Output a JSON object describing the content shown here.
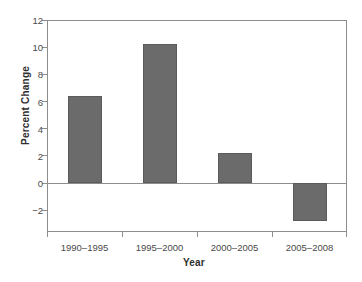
{
  "chart_data": {
    "type": "bar",
    "title": "",
    "xlabel": "Year",
    "ylabel": "Percent Change",
    "categories": [
      "1990–1995",
      "1995–2000",
      "2000–2005",
      "2005–2008"
    ],
    "values": [
      6.4,
      10.2,
      2.2,
      -2.8
    ],
    "ylim": [
      -3.6,
      12
    ],
    "yticks": [
      12,
      10,
      8,
      6,
      4,
      2,
      0,
      -2
    ],
    "ytick_labels": [
      "12",
      "10",
      "8",
      "6",
      "4",
      "2",
      "0",
      "−2"
    ],
    "grid": false,
    "legend": "none",
    "bar_color": "#6b6b6b",
    "axis_color": "#8d8d8d",
    "text_color": "#4a4a4a",
    "zero_line": 0
  }
}
